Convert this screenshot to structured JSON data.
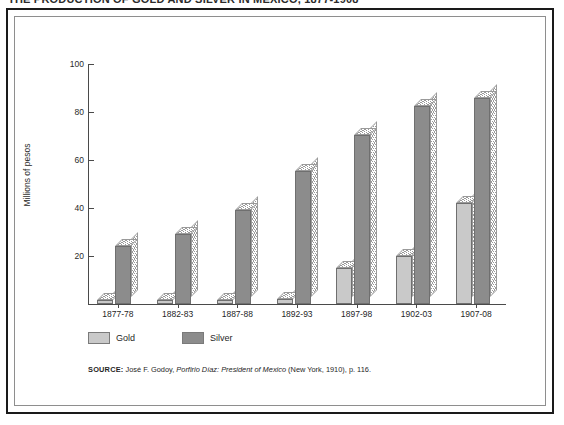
{
  "figure": {
    "title_cropped": "THE PRODUCTION OF GOLD AND SILVER IN MEXICO, 1877-1908",
    "ylabel": "Millions of pesos",
    "source_prefix": "SOURCE:",
    "source_author": "José F. Godoy,",
    "source_work": "Porfirio Díaz: President of Mexico",
    "source_pub": "(New York, 1910), p. 116."
  },
  "legend": {
    "position": "below-axis-left",
    "items": [
      {
        "label": "Gold",
        "color": "#c9c9c9"
      },
      {
        "label": "Silver",
        "color": "#8c8c8c"
      }
    ]
  },
  "chart_data": {
    "type": "bar",
    "title": "THE PRODUCTION OF GOLD AND SILVER IN MEXICO, 1877-1908",
    "xlabel": "",
    "ylabel": "Millions of pesos",
    "ylim": [
      0,
      100
    ],
    "yticks": [
      20,
      40,
      60,
      80,
      100
    ],
    "grid": false,
    "legend": "bottom-left",
    "categories": [
      "1877-78",
      "1882-83",
      "1887-88",
      "1892-93",
      "1897-98",
      "1902-03",
      "1907-08"
    ],
    "series": [
      {
        "name": "Gold",
        "color": "#c9c9c9",
        "values": [
          1.5,
          1.5,
          1.5,
          2,
          15,
          20,
          42
        ]
      },
      {
        "name": "Silver",
        "color": "#8c8c8c",
        "values": [
          24,
          29,
          39,
          55.5,
          70.5,
          82.5,
          86
        ]
      }
    ]
  }
}
